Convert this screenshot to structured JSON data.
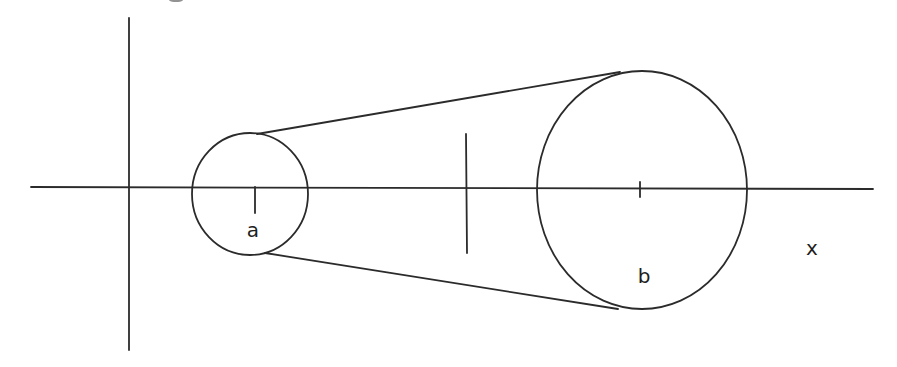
{
  "diagram": {
    "labels": {
      "small_circle": "a",
      "large_circle": "b",
      "axis": "x"
    },
    "colors": {
      "stroke": "#2b2b2b",
      "background": "#ffffff"
    },
    "elements": {
      "vertical_axis": {
        "x": 129,
        "y1": 18,
        "y2": 350
      },
      "horizontal_axis": {
        "y": 187,
        "x1": 31,
        "x2": 873
      },
      "small_circle": {
        "cx": 250,
        "cy": 194,
        "rx": 58,
        "ry": 61
      },
      "small_circle_tick": {
        "x": 255,
        "y1": 187,
        "y2": 213
      },
      "large_circle": {
        "cx": 642,
        "cy": 190,
        "rx": 105,
        "ry": 119
      },
      "large_circle_tick": {
        "x": 640,
        "y1": 182,
        "y2": 197
      },
      "middle_line": {
        "x": 466,
        "y1": 134,
        "y2": 253
      },
      "upper_tangent": {
        "x1": 257,
        "y1": 134,
        "x2": 620,
        "y2": 72
      },
      "lower_tangent": {
        "x1": 265,
        "y1": 253,
        "x2": 618,
        "y2": 309
      }
    }
  }
}
